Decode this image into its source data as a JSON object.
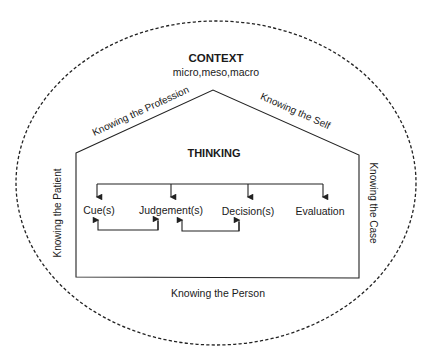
{
  "context": {
    "title": "CONTEXT",
    "subtitle": "micro,meso,macro"
  },
  "house": {
    "roof_left_label": "Knowing the Profession",
    "roof_right_label": "Knowing the Self",
    "left_wall_label": "Knowing the Patient",
    "right_wall_label": "Knowing the Case",
    "floor_label": "Knowing the Person"
  },
  "thinking": {
    "title": "THINKING",
    "steps": [
      "Cue(s)",
      "Judgement(s)",
      "Decision(s)",
      "Evaluation"
    ],
    "feedback_loops": [
      {
        "from": "Judgement(s)",
        "to": "Cue(s)"
      },
      {
        "from": "Decision(s)",
        "to": "Judgement(s)"
      }
    ]
  }
}
